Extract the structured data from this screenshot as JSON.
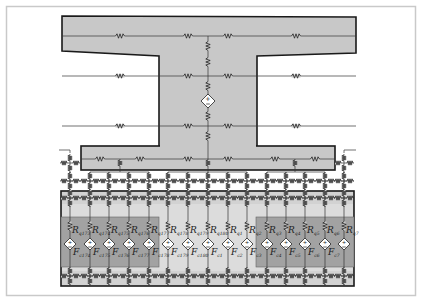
{
  "diagram": {
    "colors": {
      "frame": "#c9c9c9",
      "concrete": "#c8c8c8",
      "band_light": "#d2d2d2",
      "band_dark": "#a0a0a0",
      "outline": "#1a1a1a",
      "wire": "#333333"
    },
    "spine_x": 208,
    "top_lines_y": [
      36,
      76,
      126
    ],
    "top_resistors_x": [
      120,
      188,
      228,
      296
    ],
    "source_main": {
      "x": 208,
      "y": 101,
      "symbol": "+/-"
    },
    "columns_x": [
      70,
      90,
      109,
      129,
      149,
      168,
      188,
      208,
      228,
      247,
      267,
      286,
      305,
      325,
      344
    ],
    "resistor_labels": [
      "R_q173",
      "R_q174",
      "R_q175",
      "R_q176",
      "R_q177",
      "R_q178",
      "R_q179",
      "R_q180",
      "R_q1",
      "R_q2",
      "R_q3",
      "R_q4",
      "R_q5",
      "R_q6",
      "R_q7"
    ],
    "source_labels": [
      "F_c174",
      "F_c175",
      "F_c176",
      "F_c177",
      "F_c178",
      "F_c179",
      "F_c180",
      "F_c1",
      "F_c2",
      "F_c3",
      "F_c4",
      "F_c5",
      "F_c6",
      "F_c7",
      ""
    ],
    "label_text": {
      "R": "R",
      "F": "F"
    }
  }
}
